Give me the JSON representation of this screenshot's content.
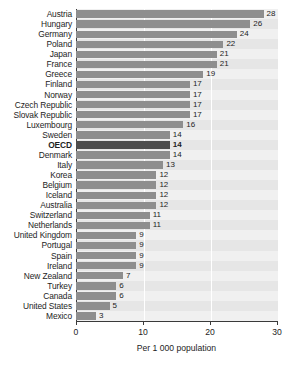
{
  "chart_data": {
    "type": "bar",
    "orientation": "horizontal",
    "title": "",
    "xlabel": "Per 1 000 population",
    "ylabel": "",
    "xlim": [
      0,
      30
    ],
    "xticks": [
      0,
      10,
      20,
      30
    ],
    "xtick_labels": [
      "0",
      "10",
      "20",
      "30"
    ],
    "grid": true,
    "legend": "none",
    "highlight_category": "OECD",
    "categories": [
      "Austria",
      "Hungary",
      "Germany",
      "Poland",
      "Japan",
      "France",
      "Greece",
      "Finland",
      "Norway",
      "Czech Republic",
      "Slovak Republic",
      "Luxembourg",
      "Sweden",
      "OECD",
      "Denmark",
      "Italy",
      "Korea",
      "Belgium",
      "Iceland",
      "Australia",
      "Switzerland",
      "Netherlands",
      "United Kingdom",
      "Portugal",
      "Spain",
      "Ireland",
      "New Zealand",
      "Turkey",
      "Canada",
      "United States",
      "Mexico"
    ],
    "values": [
      28,
      26,
      24,
      22,
      21,
      21,
      19,
      17,
      17,
      17,
      17,
      16,
      14,
      14,
      14,
      13,
      12,
      12,
      12,
      12,
      11,
      11,
      9,
      9,
      9,
      9,
      7,
      6,
      6,
      5,
      3
    ],
    "value_labels": [
      "28",
      "26",
      "24",
      "22",
      "21",
      "21",
      "19",
      "17",
      "17",
      "17",
      "17",
      "16",
      "14",
      "14",
      "14",
      "13",
      "12",
      "12",
      "12",
      "12",
      "11",
      "11",
      "9",
      "9",
      "9",
      "9",
      "7",
      "6",
      "6",
      "5",
      "3"
    ]
  },
  "colors": {
    "bar": "#8e8e8e",
    "bar_highlight": "#4d4d4d",
    "plot_background": "#f0f0f0",
    "band": "#e6e6e6",
    "axis": "#3a3a3a",
    "gridline": "#ffffff",
    "text": "#1d1d1d"
  },
  "axis": {
    "title": "Per 1 000 population"
  }
}
